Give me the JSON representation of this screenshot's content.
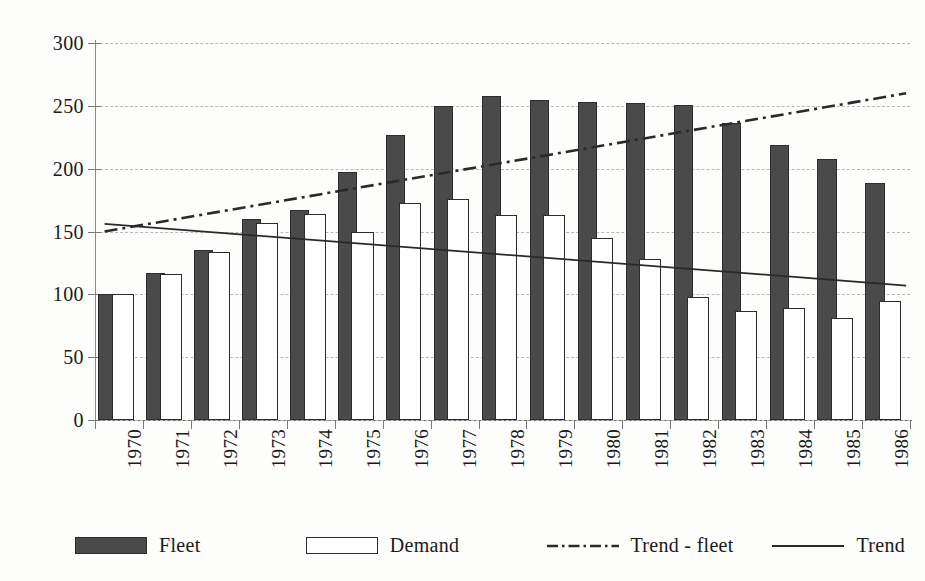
{
  "chart_data": {
    "type": "bar",
    "title": "",
    "xlabel": "",
    "ylabel": "",
    "ylim": [
      0,
      300
    ],
    "ytick_values": [
      0,
      50,
      100,
      150,
      200,
      250,
      300
    ],
    "ytick_labels": [
      "0",
      "50",
      "100",
      "150",
      "200",
      "250",
      "300"
    ],
    "grid": true,
    "grid_style": "dashed-horizontal",
    "legend_position": "bottom",
    "categories": [
      "1970",
      "1971",
      "1972",
      "1973",
      "1974",
      "1975",
      "1976",
      "1977",
      "1978",
      "1979",
      "1980",
      "1981",
      "1982",
      "1983",
      "1984",
      "1985",
      "1986"
    ],
    "series": [
      {
        "name": "Fleet",
        "type": "bar",
        "style": "filled-dark",
        "color": "#4a4a4a",
        "values": [
          100,
          117,
          135,
          160,
          167,
          197,
          227,
          250,
          258,
          255,
          253,
          252,
          251,
          236,
          219,
          208,
          189
        ]
      },
      {
        "name": "Demand",
        "type": "bar",
        "style": "outlined-white",
        "color": "#ffffff",
        "values": [
          100,
          116,
          134,
          157,
          164,
          150,
          173,
          176,
          163,
          163,
          145,
          128,
          98,
          87,
          89,
          81,
          95
        ]
      },
      {
        "name": "Trend - fleet",
        "type": "line",
        "style": "dash-dot",
        "color": "#2a2a2a",
        "endpoints": {
          "x_start": "1970",
          "y_start": 150,
          "x_end": "1986",
          "y_end": 260
        }
      },
      {
        "name": "Trend",
        "type": "line",
        "style": "solid",
        "color": "#2a2a2a",
        "endpoints": {
          "x_start": "1970",
          "y_start": 156,
          "x_end": "1986",
          "y_end": 107
        }
      }
    ],
    "legend": [
      {
        "label": "Fleet",
        "icon": "filled-square-swatch"
      },
      {
        "label": "Demand",
        "icon": "outlined-square-swatch"
      },
      {
        "label": "Trend - fleet",
        "icon": "dash-dot-line-swatch"
      },
      {
        "label": "Trend",
        "icon": "solid-line-swatch"
      }
    ]
  }
}
